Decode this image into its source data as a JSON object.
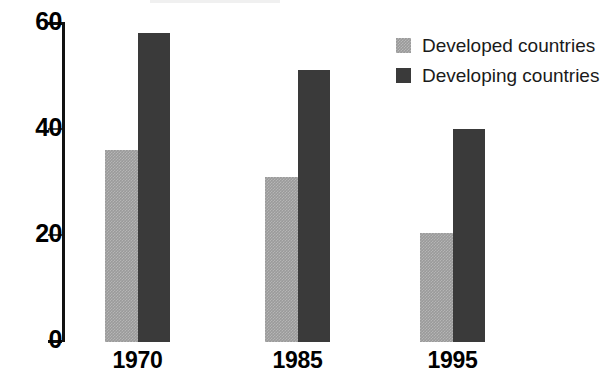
{
  "chart_data": {
    "type": "bar",
    "title": "",
    "subtitle": "",
    "xlabel": "",
    "ylabel": "",
    "categories": [
      "1970",
      "1985",
      "1995"
    ],
    "series": [
      {
        "name": "Developed countries",
        "color": "#9a9a9a",
        "values": [
          36,
          31,
          20.5
        ]
      },
      {
        "name": "Developing countries",
        "color": "#3a3a3a",
        "values": [
          58,
          51,
          40
        ]
      }
    ],
    "ylim": [
      0,
      60
    ],
    "yticks": [
      0,
      20,
      40,
      60
    ],
    "ytick_labels": [
      "0",
      "20",
      "40",
      "60"
    ],
    "grid": false,
    "legend_position": "top-right",
    "background_color": "#ffffff",
    "axis_color": "#111111"
  },
  "legend": {
    "items": [
      {
        "label": "Developed countries",
        "swatch": "developed-swatch"
      },
      {
        "label": "Developing countries",
        "swatch": "developing-swatch"
      }
    ]
  },
  "axis": {
    "ticks": [
      {
        "label": "60",
        "value": 60
      },
      {
        "label": "40",
        "value": 40
      },
      {
        "label": "20",
        "value": 20
      },
      {
        "label": "0",
        "value": 0
      }
    ]
  },
  "categories": [
    {
      "label": "1970"
    },
    {
      "label": "1985"
    },
    {
      "label": "1995"
    }
  ]
}
